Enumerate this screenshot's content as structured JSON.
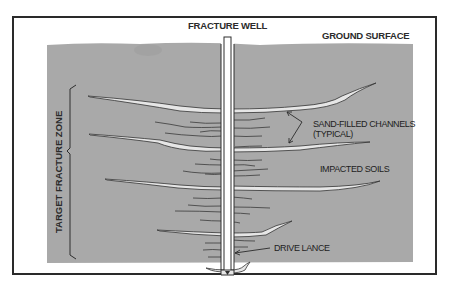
{
  "diagram": {
    "type": "cross-section",
    "labels": {
      "well": "FRACTURE WELL",
      "ground": "GROUND SURFACE",
      "channels_line1": "SAND-FILLED CHANNELS",
      "channels_line2": "(TYPICAL)",
      "soils": "IMPACTED SOILS",
      "lance": "DRIVE LANCE",
      "zone": "TARGET FRACTURE ZONE"
    },
    "colors": {
      "soil": "#a9a9a9",
      "frame": "#2a2a2a",
      "channel_fill": "#e6e6e6",
      "line": "#333333",
      "background": "#ffffff"
    }
  }
}
